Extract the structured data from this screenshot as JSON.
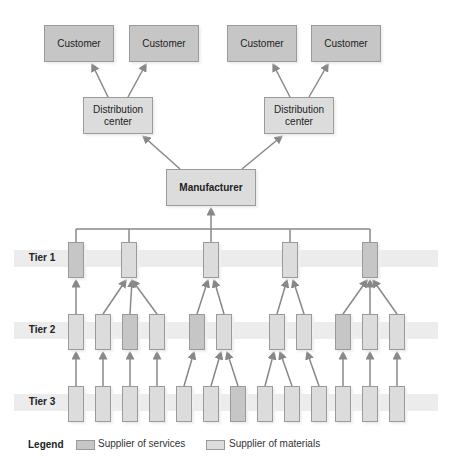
{
  "colors": {
    "service": "#c6c6c6",
    "material": "#dcdcdc",
    "band": "#ececec",
    "line": "#888888",
    "border": "#9a9a9a"
  },
  "customers": [
    "Customer",
    "Customer",
    "Customer",
    "Customer"
  ],
  "distribution_centers": [
    "Distribution center",
    "Distribution center"
  ],
  "manufacturer": "Manufacturer",
  "tiers": [
    "Tier 1",
    "Tier 2",
    "Tier 3"
  ],
  "tier1_suppliers": [
    {
      "x": 68,
      "type": "service"
    },
    {
      "x": 121,
      "type": "material"
    },
    {
      "x": 203,
      "type": "material"
    },
    {
      "x": 282,
      "type": "material"
    },
    {
      "x": 362,
      "type": "service"
    }
  ],
  "tier2_suppliers": [
    {
      "x": 68,
      "type": "material",
      "feeds": 0
    },
    {
      "x": 95,
      "type": "material",
      "feeds": 1
    },
    {
      "x": 122,
      "type": "service",
      "feeds": 1
    },
    {
      "x": 149,
      "type": "material",
      "feeds": 1
    },
    {
      "x": 189,
      "type": "service",
      "feeds": 2
    },
    {
      "x": 216,
      "type": "material",
      "feeds": 2
    },
    {
      "x": 269,
      "type": "material",
      "feeds": 3
    },
    {
      "x": 296,
      "type": "material",
      "feeds": 3
    },
    {
      "x": 335,
      "type": "service",
      "feeds": 4
    },
    {
      "x": 362,
      "type": "material",
      "feeds": 4
    },
    {
      "x": 389,
      "type": "material",
      "feeds": 4
    }
  ],
  "tier3_suppliers": [
    {
      "x": 68,
      "type": "material",
      "feeds": 0
    },
    {
      "x": 95,
      "type": "material",
      "feeds": 1
    },
    {
      "x": 122,
      "type": "material",
      "feeds": 2
    },
    {
      "x": 149,
      "type": "material",
      "feeds": 3
    },
    {
      "x": 176,
      "type": "material",
      "feeds": 4
    },
    {
      "x": 203,
      "type": "material",
      "feeds": 5
    },
    {
      "x": 230,
      "type": "service",
      "feeds": 5
    },
    {
      "x": 257,
      "type": "material",
      "feeds": 6
    },
    {
      "x": 284,
      "type": "material",
      "feeds": 6
    },
    {
      "x": 311,
      "type": "material",
      "feeds": 7
    },
    {
      "x": 335,
      "type": "material",
      "feeds": 8
    },
    {
      "x": 362,
      "type": "material",
      "feeds": 9
    },
    {
      "x": 389,
      "type": "material",
      "feeds": 10
    }
  ],
  "legend": {
    "title": "Legend",
    "service_label": "Supplier of services",
    "material_label": "Supplier of materials"
  }
}
